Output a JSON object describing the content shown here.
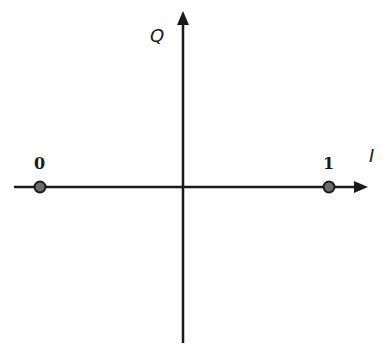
{
  "diagram": {
    "type": "constellation",
    "axes": {
      "horizontal_label": "I",
      "vertical_label": "Q"
    },
    "points": [
      {
        "label": "0",
        "position": "negative-I"
      },
      {
        "label": "1",
        "position": "positive-I"
      }
    ],
    "colors": {
      "line": "#1a1a1a",
      "point_fill": "#6b6b6b",
      "point_stroke": "#1a1a1a",
      "background": "#ffffff"
    }
  }
}
